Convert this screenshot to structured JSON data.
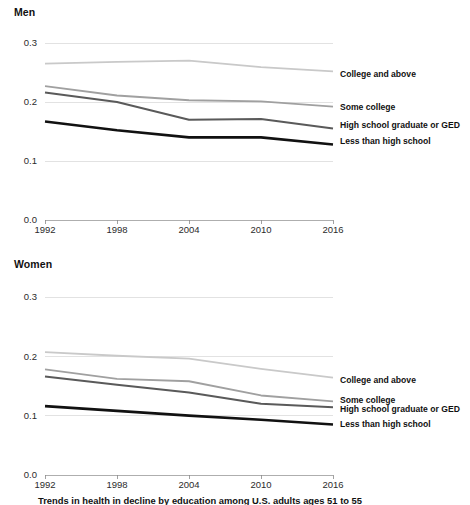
{
  "caption": "Trends in health in decline by education among U.S. adults ages 51 to 55",
  "colors": {
    "college_and_above": "#c9c9c9",
    "some_college": "#a0a0a0",
    "high_school_graduate_or_ged": "#5a5a5a",
    "less_than_high_school": "#111111",
    "gridline": "#d5d5d5",
    "axis": "#9a9a9a",
    "text": "#111111"
  },
  "panels": [
    {
      "id": "men",
      "title": "Men"
    },
    {
      "id": "women",
      "title": "Women"
    }
  ],
  "chart_data": [
    {
      "type": "line",
      "title": "Men",
      "xlabel": "",
      "ylabel": "",
      "x": [
        1992,
        1998,
        2004,
        2010,
        2016
      ],
      "xtick_labels": [
        "1992",
        "1998",
        "2004",
        "2010",
        "2016"
      ],
      "xlim": [
        1992,
        2016
      ],
      "ylim": [
        0.0,
        0.3
      ],
      "yticks": [
        0.0,
        0.1,
        0.2,
        0.3
      ],
      "ytick_labels": [
        "0.0",
        "0.1",
        "0.2",
        "0.3"
      ],
      "grid": true,
      "legend_position": "right-inline",
      "series": [
        {
          "name": "College and above",
          "color": "#c9c9c9",
          "width": 1.8,
          "label_y": 0.247,
          "values": [
            0.265,
            0.268,
            0.27,
            0.259,
            0.252
          ]
        },
        {
          "name": "Some college",
          "color": "#a0a0a0",
          "width": 1.8,
          "label_y": 0.192,
          "values": [
            0.227,
            0.211,
            0.203,
            0.201,
            0.192
          ]
        },
        {
          "name": "High school graduate or GED",
          "color": "#5a5a5a",
          "width": 2.0,
          "label_y": 0.162,
          "values": [
            0.216,
            0.2,
            0.17,
            0.171,
            0.155
          ]
        },
        {
          "name": "Less than high school",
          "color": "#111111",
          "width": 2.6,
          "label_y": 0.134,
          "values": [
            0.167,
            0.152,
            0.14,
            0.14,
            0.128
          ]
        }
      ]
    },
    {
      "type": "line",
      "title": "Women",
      "xlabel": "",
      "ylabel": "",
      "x": [
        1992,
        1998,
        2004,
        2010,
        2016
      ],
      "xtick_labels": [
        "1992",
        "1998",
        "2004",
        "2010",
        "2016"
      ],
      "xlim": [
        1992,
        2016
      ],
      "ylim": [
        0.0,
        0.3
      ],
      "yticks": [
        0.0,
        0.1,
        0.2,
        0.3
      ],
      "ytick_labels": [
        "0.0",
        "0.1",
        "0.2",
        "0.3"
      ],
      "grid": true,
      "legend_position": "right-inline",
      "series": [
        {
          "name": "College and above",
          "color": "#c9c9c9",
          "width": 1.8,
          "label_y": 0.161,
          "values": [
            0.207,
            0.201,
            0.196,
            0.179,
            0.164
          ]
        },
        {
          "name": "Some college",
          "color": "#a0a0a0",
          "width": 1.8,
          "label_y": 0.127,
          "values": [
            0.178,
            0.162,
            0.158,
            0.134,
            0.124
          ]
        },
        {
          "name": "High school graduate or GED",
          "color": "#5a5a5a",
          "width": 2.0,
          "label_y": 0.112,
          "values": [
            0.166,
            0.152,
            0.139,
            0.12,
            0.114
          ]
        },
        {
          "name": "Less than high school",
          "color": "#111111",
          "width": 2.6,
          "label_y": 0.086,
          "values": [
            0.116,
            0.108,
            0.1,
            0.093,
            0.085
          ]
        }
      ]
    }
  ]
}
